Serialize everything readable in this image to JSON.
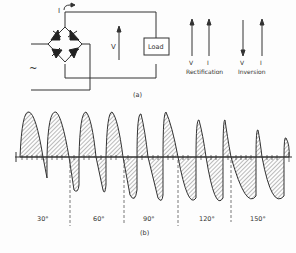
{
  "figure": {
    "part_a": {
      "caption": "(a)",
      "current_label": "I",
      "voltage_label": "V",
      "load_label": "Load",
      "ac_source_symbol": "~",
      "modes": [
        {
          "name": "Rectification",
          "v_label": "V",
          "i_label": "I",
          "v_direction": "up",
          "i_direction": "up"
        },
        {
          "name": "Inversion",
          "v_label": "V",
          "i_label": "I",
          "v_direction": "down",
          "i_direction": "up"
        }
      ]
    },
    "part_b": {
      "caption": "(b)",
      "firing_angles": [
        "30°",
        "60°",
        "90°",
        "120°",
        "150°"
      ]
    }
  }
}
